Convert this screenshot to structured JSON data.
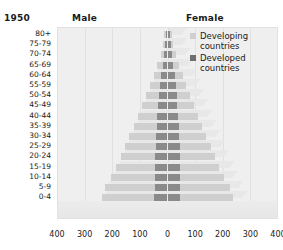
{
  "header": {
    "year": "1950",
    "male_label": "Male",
    "female_label": "Female"
  },
  "legend": {
    "items": [
      {
        "label": "Developing countries",
        "color": "#cfcfcf",
        "key": "developing"
      },
      {
        "label": "Developed countries",
        "color": "#6f6f6f",
        "key": "developed"
      }
    ]
  },
  "chart_data": {
    "type": "bar",
    "subtype": "population-pyramid",
    "title": "1950",
    "xlabel": "",
    "ylabel": "",
    "xlim": [
      -400,
      400
    ],
    "xticks": [
      400,
      300,
      200,
      100,
      0,
      100,
      200,
      300,
      400
    ],
    "xtick_labels": [
      "400",
      "300",
      "200",
      "100",
      "0",
      "100",
      "200",
      "300",
      "400"
    ],
    "grid": true,
    "legend_position": "top-right",
    "units": "millions",
    "left_panel": "Male",
    "right_panel": "Female",
    "categories": [
      "80+",
      "75-79",
      "70-74",
      "65-69",
      "60-64",
      "55-59",
      "50-54",
      "45-49",
      "40-44",
      "35-39",
      "30-34",
      "25-29",
      "20-24",
      "15-19",
      "10-14",
      "5-9",
      "0-4"
    ],
    "series": [
      {
        "name": "Developed countries",
        "key": "developed",
        "color": "#8a8a8a",
        "male": [
          7,
          8,
          12,
          17,
          22,
          27,
          31,
          34,
          37,
          39,
          41,
          43,
          44,
          45,
          45,
          47,
          48
        ],
        "female": [
          10,
          11,
          16,
          21,
          26,
          30,
          34,
          36,
          38,
          40,
          42,
          44,
          44,
          45,
          44,
          46,
          47
        ]
      },
      {
        "name": "Developing countries",
        "key": "developing",
        "color": "#cfcfcf",
        "male": [
          5,
          8,
          13,
          20,
          28,
          37,
          47,
          58,
          70,
          83,
          97,
          112,
          126,
          142,
          158,
          178,
          190
        ],
        "female": [
          6,
          9,
          14,
          21,
          29,
          38,
          48,
          59,
          71,
          84,
          98,
          113,
          127,
          143,
          159,
          179,
          191
        ]
      }
    ]
  }
}
